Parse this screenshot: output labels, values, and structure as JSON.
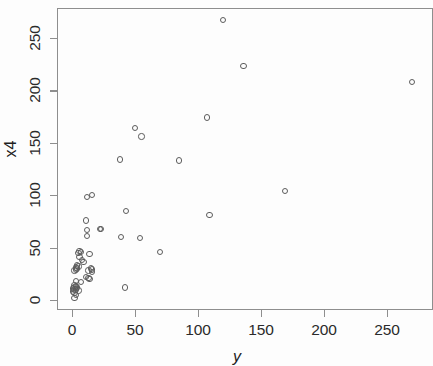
{
  "chart_data": {
    "type": "scatter",
    "title": "",
    "xlabel": "y",
    "ylabel": "x4",
    "xlim": [
      -10,
      285
    ],
    "ylim": [
      -10,
      278
    ],
    "grid": false,
    "legend": null,
    "marker": "open-circle",
    "marker_color": "#5c5c5c",
    "xticks": [
      0,
      50,
      100,
      150,
      200,
      250
    ],
    "yticks": [
      0,
      50,
      100,
      150,
      200,
      250
    ],
    "xticklabels": [
      "0",
      "50",
      "100",
      "150",
      "200",
      "250"
    ],
    "yticklabels": [
      "0",
      "50",
      "100",
      "150",
      "200",
      "250"
    ],
    "n_points": 56,
    "points": [
      {
        "x": 120,
        "y": 267
      },
      {
        "x": 136,
        "y": 223
      },
      {
        "x": 270,
        "y": 208
      },
      {
        "x": 107,
        "y": 174
      },
      {
        "x": 50,
        "y": 164
      },
      {
        "x": 55,
        "y": 156
      },
      {
        "x": 38,
        "y": 134
      },
      {
        "x": 85,
        "y": 133
      },
      {
        "x": 169,
        "y": 104
      },
      {
        "x": 16,
        "y": 100
      },
      {
        "x": 12,
        "y": 98
      },
      {
        "x": 43,
        "y": 85
      },
      {
        "x": 109,
        "y": 81
      },
      {
        "x": 11,
        "y": 76
      },
      {
        "x": 22,
        "y": 68
      },
      {
        "x": 23,
        "y": 68
      },
      {
        "x": 12,
        "y": 67
      },
      {
        "x": 12,
        "y": 61
      },
      {
        "x": 39,
        "y": 60
      },
      {
        "x": 54,
        "y": 59
      },
      {
        "x": 70,
        "y": 46
      },
      {
        "x": 6,
        "y": 47
      },
      {
        "x": 7,
        "y": 46
      },
      {
        "x": 5,
        "y": 45
      },
      {
        "x": 14,
        "y": 44
      },
      {
        "x": 6,
        "y": 41
      },
      {
        "x": 8,
        "y": 38
      },
      {
        "x": 9,
        "y": 36
      },
      {
        "x": 4,
        "y": 33
      },
      {
        "x": 5,
        "y": 32
      },
      {
        "x": 3,
        "y": 31
      },
      {
        "x": 4,
        "y": 30
      },
      {
        "x": 15,
        "y": 30
      },
      {
        "x": 16,
        "y": 29
      },
      {
        "x": 13,
        "y": 28
      },
      {
        "x": 16,
        "y": 27
      },
      {
        "x": 3,
        "y": 29
      },
      {
        "x": 2,
        "y": 28
      },
      {
        "x": 11,
        "y": 22
      },
      {
        "x": 13,
        "y": 21
      },
      {
        "x": 14,
        "y": 20
      },
      {
        "x": 3,
        "y": 18
      },
      {
        "x": 7,
        "y": 17
      },
      {
        "x": 42,
        "y": 12
      },
      {
        "x": 2,
        "y": 14
      },
      {
        "x": 3,
        "y": 13
      },
      {
        "x": 2,
        "y": 12
      },
      {
        "x": 4,
        "y": 12
      },
      {
        "x": 1,
        "y": 11
      },
      {
        "x": 2,
        "y": 10
      },
      {
        "x": 3,
        "y": 10
      },
      {
        "x": 5,
        "y": 9
      },
      {
        "x": 1,
        "y": 8
      },
      {
        "x": 2,
        "y": 7
      },
      {
        "x": 3,
        "y": 5
      },
      {
        "x": 2,
        "y": 2
      }
    ]
  },
  "geometry": {
    "frame": {
      "left": 57,
      "top": 8,
      "right": 433,
      "bottom": 310
    },
    "x_axis": {
      "pixel_at_0": 72,
      "pixel_per_unit": 1.26
    },
    "y_axis": {
      "pixel_at_0": 300,
      "pixel_per_unit": 1.048
    }
  }
}
